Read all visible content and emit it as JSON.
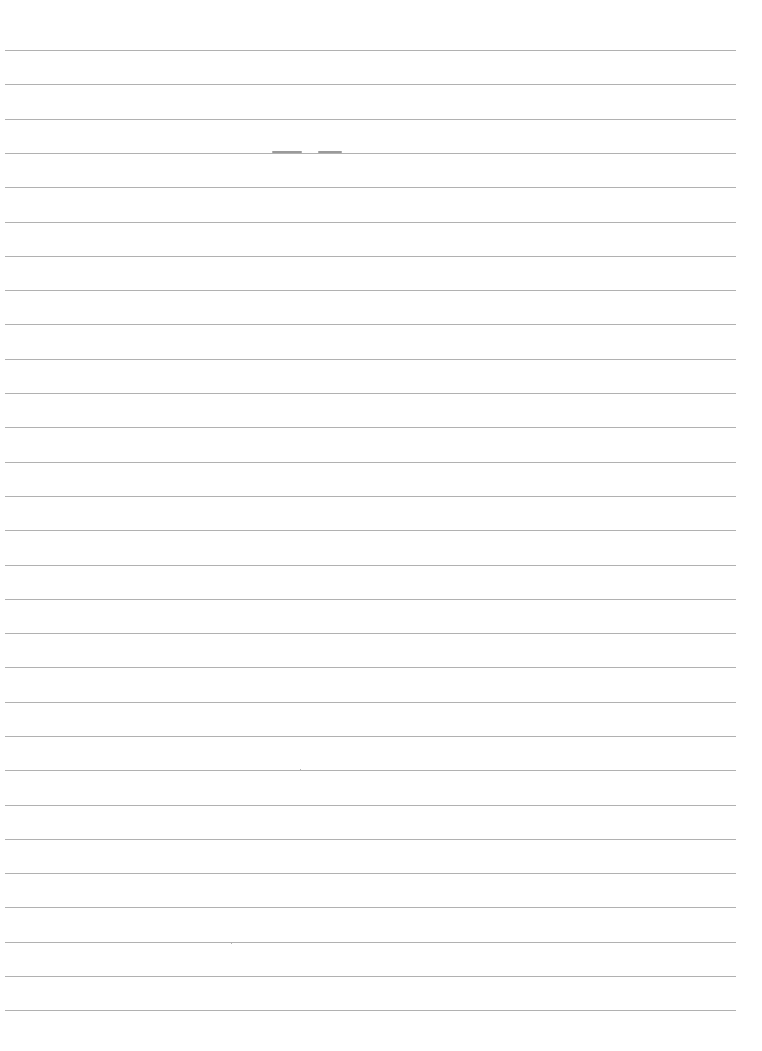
{
  "page": {
    "type": "blank ruled sheet",
    "background_color": "#ffffff",
    "rule_color": "#a9a9a9",
    "rule_count": 29,
    "first_rule_y": 50,
    "rule_spacing": 34.3,
    "rule_left": 5,
    "rule_right": 736,
    "text_content": ""
  }
}
